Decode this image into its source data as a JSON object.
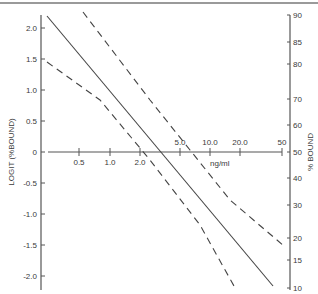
{
  "chart_data": {
    "type": "line",
    "title": "",
    "xlabel": "ng/ml",
    "ylabel": "LOGIT (%BOUND)",
    "y2label": "% BOUND",
    "x_scale": "log",
    "x_ticks": [
      {
        "label": "0.5",
        "px": 79
      },
      {
        "label": "1.0",
        "px": 110
      },
      {
        "label": "2.0",
        "px": 140
      },
      {
        "label": "5.0",
        "px": 180
      },
      {
        "label": "10.0",
        "px": 210
      },
      {
        "label": "20.0",
        "px": 240
      },
      {
        "label": "50",
        "px": 282
      }
    ],
    "y_ticks": [
      {
        "label": "2.0",
        "value": 2.0
      },
      {
        "label": "1.5",
        "value": 1.5
      },
      {
        "label": "1.0",
        "value": 1.0
      },
      {
        "label": "0.5",
        "value": 0.5
      },
      {
        "label": "0",
        "value": 0
      },
      {
        "label": "-0.5",
        "value": -0.5
      },
      {
        "label": "-1.0",
        "value": -1.0
      },
      {
        "label": "-1.5",
        "value": -1.5
      },
      {
        "label": "-2.0",
        "value": -2.0
      }
    ],
    "y2_ticks": [
      {
        "label": "90",
        "px": 15
      },
      {
        "label": "85",
        "px": 42
      },
      {
        "label": "80",
        "px": 64
      },
      {
        "label": "70",
        "px": 99
      },
      {
        "label": "60",
        "px": 125
      },
      {
        "label": "50",
        "px": 152
      },
      {
        "label": "40",
        "px": 178
      },
      {
        "label": "30",
        "px": 205
      },
      {
        "label": "20",
        "px": 238
      },
      {
        "label": "15",
        "px": 260
      },
      {
        "label": "10",
        "px": 288
      }
    ],
    "ylim": [
      -2.2,
      2.2
    ],
    "y2lim": [
      10,
      90
    ],
    "series": [
      {
        "name": "regression line",
        "style": "solid",
        "points_px": [
          [
            47,
            16
          ],
          [
            273,
            286
          ]
        ]
      },
      {
        "name": "upper confidence limit",
        "style": "dashed",
        "points_px": [
          [
            83,
            12
          ],
          [
            150,
            100
          ],
          [
            190,
            150
          ],
          [
            230,
            200
          ],
          [
            284,
            246
          ]
        ]
      },
      {
        "name": "lower confidence limit",
        "style": "dashed",
        "points_px": [
          [
            47,
            62
          ],
          [
            100,
            100
          ],
          [
            150,
            160
          ],
          [
            200,
            225
          ],
          [
            234,
            286
          ]
        ]
      }
    ],
    "grid": false,
    "legend": null
  }
}
